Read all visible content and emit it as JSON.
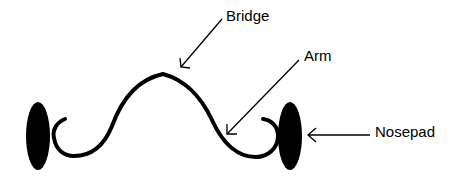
{
  "diagram": {
    "title": "",
    "colors": {
      "stroke": "#000000",
      "fill": "#000000",
      "background": "#ffffff"
    },
    "labels": [
      {
        "id": "bridge",
        "text": "Bridge",
        "points_to": "top of bridge curve"
      },
      {
        "id": "arm",
        "text": "Arm",
        "points_to": "right descending arm near nosepad"
      },
      {
        "id": "nosepad",
        "text": "Nosepad",
        "points_to": "right nosepad"
      }
    ],
    "parts": {
      "left_nosepad": "filled ellipse",
      "right_nosepad": "filled ellipse",
      "bridge": "curved wire connecting both nosepads",
      "arrows": [
        "bridge-arrow",
        "arm-arrow",
        "nosepad-arrow"
      ]
    }
  }
}
